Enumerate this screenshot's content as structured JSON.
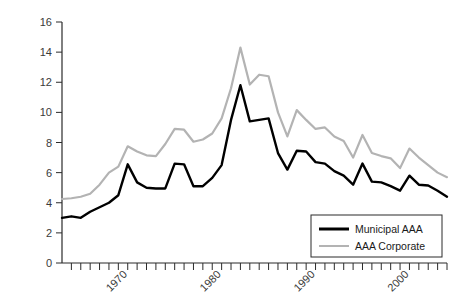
{
  "chart_data": {
    "type": "line",
    "title": "",
    "subtitle": "",
    "xlabel": "",
    "ylabel": "",
    "xlim": [
      1963,
      2004
    ],
    "ylim": [
      0,
      16
    ],
    "y_ticks": [
      0,
      2,
      4,
      6,
      8,
      10,
      12,
      14,
      16
    ],
    "y_tick_labels": [
      "0",
      "2",
      "4",
      "6",
      "8",
      "10",
      "12",
      "14",
      "16"
    ],
    "x_ticks_labeled": [
      1970,
      1980,
      1990,
      2000
    ],
    "x_tick_labels": [
      "1970",
      "1980",
      "1990",
      "2000"
    ],
    "x_minor_tick_interval": 1,
    "grid": false,
    "legend_position": "bottom-right",
    "x": [
      1963,
      1964,
      1965,
      1966,
      1967,
      1968,
      1969,
      1970,
      1971,
      1972,
      1973,
      1974,
      1975,
      1976,
      1977,
      1978,
      1979,
      1980,
      1981,
      1982,
      1983,
      1984,
      1985,
      1986,
      1987,
      1988,
      1989,
      1990,
      1991,
      1992,
      1993,
      1994,
      1995,
      1996,
      1997,
      1998,
      1999,
      2000,
      2001,
      2002,
      2003,
      2004
    ],
    "series": [
      {
        "name": "Municipal AAA",
        "color": "#000000",
        "line_width": 2.4,
        "values": [
          3.0,
          3.1,
          3.0,
          3.4,
          3.7,
          4.0,
          4.5,
          6.55,
          5.35,
          5.0,
          4.95,
          4.95,
          6.6,
          6.55,
          5.1,
          5.1,
          5.65,
          6.5,
          9.5,
          11.8,
          9.4,
          9.5,
          9.6,
          7.3,
          6.2,
          7.45,
          7.4,
          6.7,
          6.6,
          6.1,
          5.8,
          5.2,
          6.6,
          5.4,
          5.35,
          5.1,
          4.8,
          5.8,
          5.2,
          5.15,
          4.8,
          4.4
        ]
      },
      {
        "name": "AAA Corporate",
        "color": "#b3b3b3",
        "line_width": 2.2,
        "values": [
          4.25,
          4.3,
          4.4,
          4.6,
          5.2,
          6.0,
          6.4,
          7.75,
          7.4,
          7.15,
          7.1,
          7.9,
          8.9,
          8.85,
          8.05,
          8.2,
          8.6,
          9.6,
          11.6,
          14.3,
          11.85,
          12.5,
          12.4,
          10.0,
          8.4,
          10.15,
          9.5,
          8.9,
          9.0,
          8.4,
          8.1,
          7.0,
          8.5,
          7.3,
          7.1,
          6.95,
          6.3,
          7.6,
          7.0,
          6.5,
          6.0,
          5.7
        ]
      }
    ]
  },
  "legend": {
    "entries": [
      {
        "label": "Municipal AAA",
        "swatch_color": "#000000",
        "swatch_width": 3
      },
      {
        "label": "AAA Corporate",
        "swatch_color": "#b3b3b3",
        "swatch_width": 2
      }
    ]
  },
  "axes": {
    "axis_color": "#2b2b2b",
    "label_color": "#3a3a3a"
  }
}
